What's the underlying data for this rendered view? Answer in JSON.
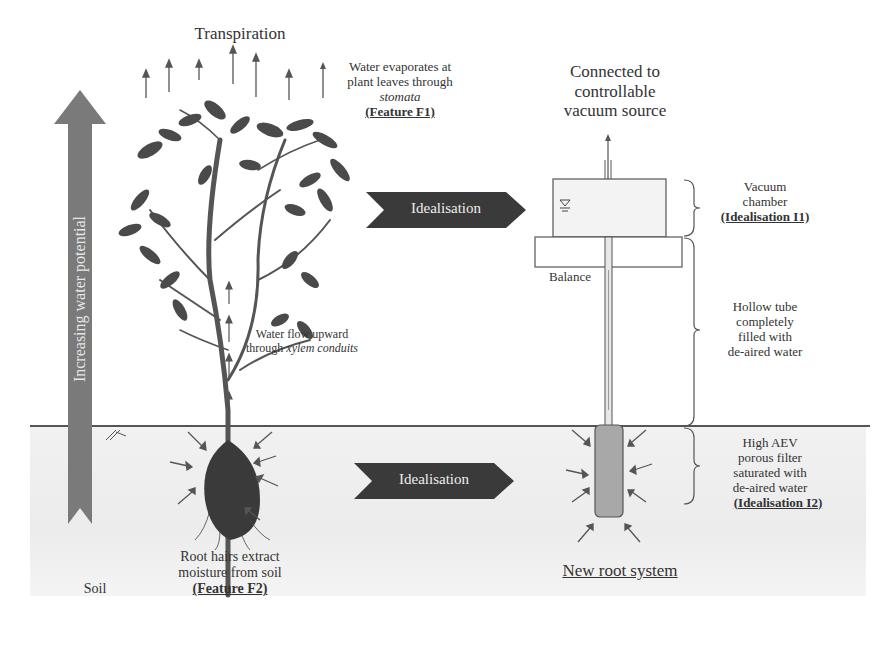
{
  "diagram": {
    "left": {
      "title": "Transpiration",
      "feature_f1": {
        "line1": "Water evaporates at",
        "line2": "plant leaves through",
        "line3": "stomata",
        "label": "(Feature F1)"
      },
      "xylem": {
        "line1": "Water flow upward",
        "line2_plain": "through ",
        "line2_italic": "xylem conduits"
      },
      "feature_f2": {
        "line1": "Root hairs extract",
        "line2": "moisture from soil",
        "label": "(Feature F2)"
      },
      "potential_arrow_label": "Increasing water potential",
      "soil_label": "Soil"
    },
    "middle": {
      "arrow_top_label": "Idealisation",
      "arrow_bottom_label": "Idealisation"
    },
    "right": {
      "vacuum_source": {
        "line1": "Connected to",
        "line2": "controllable",
        "line3": "vacuum source"
      },
      "balance_label": "Balance",
      "vacuum_chamber": {
        "line1": "Vacuum",
        "line2": "chamber",
        "label": "(Idealisation I1)"
      },
      "hollow_tube": {
        "line1": "Hollow tube",
        "line2": "completely",
        "line3": "filled with",
        "line4": "de-aired water"
      },
      "porous_filter": {
        "line1": "High AEV",
        "line2": "porous filter",
        "line3": "saturated with",
        "line4": "de-aired water",
        "label": "(Idealisation I2)"
      },
      "new_root_label": "New root system"
    },
    "colors": {
      "arrow_dark": "#3a3a3a",
      "potential_arrow": "#7a7a7a",
      "soil_bg": "#eeeeee",
      "filter_fill": "#a8a8a8"
    }
  }
}
